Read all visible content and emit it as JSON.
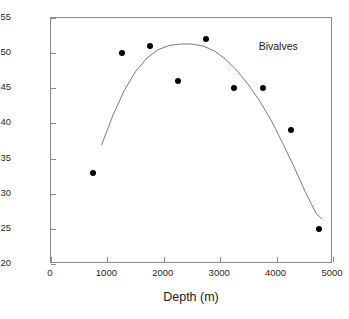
{
  "chart_data": {
    "type": "scatter",
    "title": "",
    "annotation": "Bivalves",
    "xlabel": "Depth (m)",
    "ylabel": "Number of Species",
    "xlim": [
      0,
      5000
    ],
    "ylim": [
      20,
      55
    ],
    "xticks": [
      0,
      1000,
      2000,
      3000,
      4000,
      5000
    ],
    "yticks": [
      20,
      25,
      30,
      35,
      40,
      45,
      50,
      55
    ],
    "xtick_labels": [
      "0",
      "1000",
      "2000",
      "3000",
      "4000",
      "5000"
    ],
    "ytick_labels": [
      "20",
      "25",
      "30",
      "35",
      "40",
      "45",
      "50",
      "55"
    ],
    "grid": false,
    "legend": "none",
    "marker": "filled-circle",
    "marker_color": "#000000",
    "fit_line_color": "#7a7a7a",
    "x": [
      750,
      1250,
      1750,
      2250,
      2750,
      3250,
      3750,
      4250,
      4750
    ],
    "y": [
      33,
      50,
      51,
      46,
      52,
      45,
      45,
      39,
      25
    ],
    "points": [
      {
        "x": 750,
        "y": 33
      },
      {
        "x": 1250,
        "y": 50
      },
      {
        "x": 1750,
        "y": 51
      },
      {
        "x": 2250,
        "y": 46
      },
      {
        "x": 2750,
        "y": 52
      },
      {
        "x": 3250,
        "y": 45
      },
      {
        "x": 3750,
        "y": 45
      },
      {
        "x": 4250,
        "y": 39
      },
      {
        "x": 4750,
        "y": 25
      }
    ],
    "fit_curve": {
      "description": "quadratic fit, peak near 2500 m",
      "x": [
        900,
        1100,
        1300,
        1500,
        1700,
        1900,
        2100,
        2300,
        2500,
        2700,
        2900,
        3100,
        3300,
        3500,
        3700,
        3900,
        4100,
        4300,
        4500,
        4700,
        4800
      ],
      "y": [
        37.0,
        41.2,
        44.7,
        47.4,
        49.3,
        50.5,
        51.1,
        51.3,
        51.3,
        51.0,
        50.3,
        49.1,
        47.5,
        45.5,
        43.2,
        40.5,
        37.3,
        34.0,
        30.4,
        27.2,
        26.4
      ]
    }
  },
  "figure": {
    "background_color": "#ffffff",
    "axis_color": "#8a8a8a",
    "text_color": "#1a1a1a"
  }
}
